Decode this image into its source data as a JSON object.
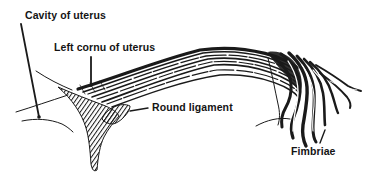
{
  "figure": {
    "labels": {
      "cavity_of_uterus": "Cavity of uterus",
      "left_cornu_of_uterus": "Left cornu of uterus",
      "round_ligament": "Round ligament",
      "fimbriae": "Fimbriae"
    },
    "colors": {
      "ink": "#1a1a1a",
      "background": "#ffffff"
    }
  }
}
